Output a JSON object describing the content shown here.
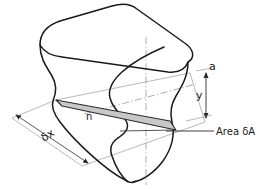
{
  "figure": {
    "labels": {
      "top_edge": "a",
      "distance": "y",
      "neutral_axis": "n",
      "width_element": "δx",
      "area_element": "Area δA"
    },
    "colors": {
      "outline": "#1a1a1a",
      "strip_fill": "#c8c8c8",
      "strip_outline": "#2b2b2b",
      "thin_line": "#8a8a8a",
      "background": "#ffffff"
    }
  }
}
